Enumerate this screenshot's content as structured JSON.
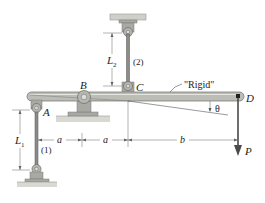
{
  "diagram": {
    "title": "",
    "labels": {
      "pin_a": "A",
      "pin_b": "B",
      "pin_c": "C",
      "point_d": "D",
      "rod_1": "(1)",
      "rod_2": "(2)",
      "length_1": "L",
      "length_1_sub": "1",
      "length_2": "L",
      "length_2_sub": "2",
      "rigid_note": "\"Rigid\"",
      "angle": "θ",
      "load": "P",
      "dim_a1": "a",
      "dim_a2": "a",
      "dim_b": "b"
    },
    "colors": {
      "bar": "#b9b9b3",
      "bar_edge": "#6f6f6a",
      "bracket": "#9a9a94",
      "ground": "#cfcfc9",
      "rod": "#7c7c78",
      "arrow": "#4a4a4a",
      "line": "#555555"
    }
  }
}
